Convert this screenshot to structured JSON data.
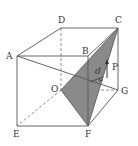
{
  "diagram": {
    "type": "cube-geometry",
    "vertices": {
      "A": {
        "label": "A",
        "x": 17,
        "y": 56
      },
      "B": {
        "label": "B",
        "x": 88,
        "y": 56
      },
      "C": {
        "label": "C",
        "x": 118,
        "y": 28
      },
      "D": {
        "label": "D",
        "x": 61,
        "y": 28
      },
      "E": {
        "label": "E",
        "x": 17,
        "y": 126
      },
      "F": {
        "label": "F",
        "x": 88,
        "y": 126
      },
      "G": {
        "label": "G",
        "x": 118,
        "y": 90
      },
      "O": {
        "label": "O",
        "x": 61,
        "y": 90
      }
    },
    "annotations": {
      "d": "d",
      "P": "P"
    },
    "shaded_plane": [
      "O",
      "C",
      "F"
    ],
    "colors": {
      "edge": "#555555",
      "shade": "#8a8a8a",
      "shade_dark": "#6e6e6e",
      "label": "#333333"
    }
  }
}
